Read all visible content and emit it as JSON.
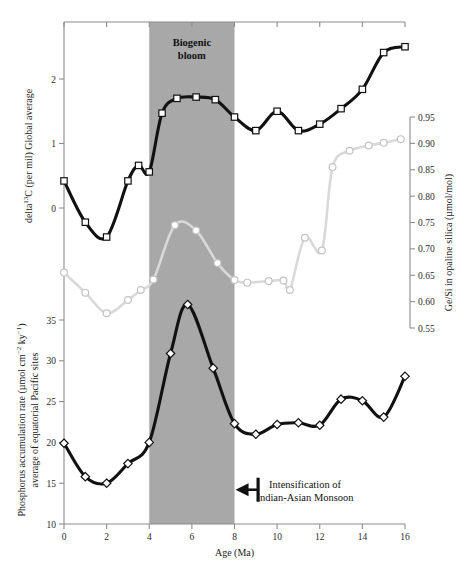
{
  "figure": {
    "background": "#ffffff",
    "band_color": "#a8a8a8",
    "dark_series_color": "#111111",
    "light_series_color": "#d9d9d9"
  },
  "xaxis": {
    "label": "Age (Ma)",
    "ticks": [
      0,
      2,
      4,
      6,
      8,
      10,
      12,
      14,
      16
    ],
    "tick_labels": [
      "0",
      "2",
      "4",
      "6",
      "8",
      "10",
      "12",
      "14",
      "16"
    ],
    "range": [
      0,
      16
    ],
    "minor_step": 1
  },
  "axis_left_top": {
    "label": "delta¹³C (per mil) Global average",
    "label_plain": "delta 13C (per mil) Global average",
    "ticks": [
      0,
      1,
      2
    ],
    "tick_labels": [
      "0",
      "1",
      "2"
    ],
    "range": [
      -0.75,
      2.75
    ],
    "units": "per mil"
  },
  "axis_left_bottom": {
    "label": "Phosphorus accumulation rate (µmol cm⁻² ky⁻¹) average of equatorial Pacific sites",
    "label_line1": "Phosphorus accumulation rate (µmol cm⁻² ky⁻¹)",
    "label_line2": "average of equatorial Pacific sites",
    "ticks": [
      10,
      15,
      20,
      25,
      30,
      35
    ],
    "tick_labels": [
      "10",
      "15",
      "20",
      "25",
      "30",
      "35"
    ],
    "range": [
      10,
      38.5
    ],
    "units": "µmol cm^-2 ky^-1"
  },
  "axis_right": {
    "label": "Ge/Si in opaline silica (µmol/mol)",
    "ticks": [
      0.55,
      0.6,
      0.65,
      0.7,
      0.75,
      0.8,
      0.85,
      0.9,
      0.95
    ],
    "tick_labels": [
      "0.55",
      "0.60",
      "0.65",
      "0.70",
      "0.75",
      "0.80",
      "0.85",
      "0.90",
      "0.95"
    ],
    "range": [
      0.53,
      0.97
    ],
    "units": "µmol/mol"
  },
  "annotations": {
    "band": {
      "text_line1": "Biogenic",
      "text_line2": "bloom",
      "x_start": 4,
      "x_end": 8
    },
    "monsoon": {
      "text_line1": "Intensification of",
      "text_line2": "Indian-Asian Monsoon",
      "arrow_direction": "left",
      "arrow_from_x": 8.45,
      "arrow_to_x": 8.05,
      "arrow_y_value": 14.2
    }
  },
  "chart_data": {
    "type": "line",
    "title": "",
    "xlabel": "Age (Ma)",
    "grid": false,
    "legend": "none",
    "xlim": [
      0,
      16
    ],
    "series": [
      {
        "name": "delta 13C (per mil) Global average",
        "axis": "left-top",
        "ylabel": "delta13C (per mil) Global average",
        "ylim": [
          -0.75,
          2.75
        ],
        "color": "#111111",
        "marker": "square",
        "x": [
          0,
          1,
          2,
          3,
          3.5,
          4,
          4.6,
          5.3,
          6.2,
          7.1,
          8,
          9,
          10,
          11,
          12,
          13,
          14,
          15,
          16
        ],
        "y": [
          0.42,
          -0.22,
          -0.45,
          0.42,
          0.66,
          0.56,
          1.47,
          1.7,
          1.72,
          1.68,
          1.41,
          1.2,
          1.5,
          1.2,
          1.3,
          1.54,
          1.84,
          2.41,
          2.5
        ]
      },
      {
        "name": "Ge/Si in opaline silica",
        "axis": "right",
        "ylabel": "Ge/Si in opaline silica (umol/mol)",
        "ylim": [
          0.53,
          0.97
        ],
        "color": "#d9d9d9",
        "marker": "circle",
        "x": [
          0,
          1,
          2,
          3,
          3.6,
          4.2,
          5.2,
          6.2,
          7.2,
          8.0,
          8.6,
          9.6,
          10.3,
          10.6,
          11.3,
          12.1,
          12.6,
          13.4,
          14.3,
          15.0,
          15.8
        ],
        "y": [
          0.655,
          0.617,
          0.578,
          0.603,
          0.622,
          0.642,
          0.745,
          0.735,
          0.673,
          0.641,
          0.636,
          0.639,
          0.64,
          0.622,
          0.721,
          0.697,
          0.855,
          0.886,
          0.896,
          0.901,
          0.908
        ]
      },
      {
        "name": "Phosphorus accumulation rate",
        "axis": "left-bottom",
        "ylabel": "Phosphorus accumulation rate (umol cm-2 ky-1)",
        "ylim": [
          10,
          38.5
        ],
        "color": "#111111",
        "marker": "diamond",
        "x": [
          0,
          1,
          2,
          3,
          4,
          5,
          5.8,
          7,
          8,
          9,
          10,
          11,
          12,
          13,
          14,
          15,
          16
        ],
        "y": [
          19.9,
          15.8,
          15.0,
          17.4,
          20.0,
          30.9,
          36.9,
          29.1,
          22.3,
          21.0,
          22.2,
          22.4,
          22.1,
          25.3,
          25.1,
          23.1,
          28.1
        ]
      }
    ]
  }
}
